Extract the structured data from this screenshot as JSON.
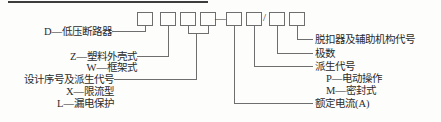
{
  "diagram": {
    "title_bar_present": true,
    "type": "model-designation-breakdown",
    "boxes": [
      {
        "id": "box-1",
        "label": "",
        "x": 137,
        "y": 12,
        "w": 16,
        "h": 14
      },
      {
        "id": "box-2",
        "label": "",
        "x": 160,
        "y": 12,
        "w": 16,
        "h": 14
      },
      {
        "id": "box-3",
        "label": "",
        "x": 180,
        "y": 12,
        "w": 16,
        "h": 14
      },
      {
        "id": "box-4",
        "label": "",
        "x": 200,
        "y": 12,
        "w": 16,
        "h": 14
      },
      {
        "id": "box-5",
        "label": "",
        "x": 226,
        "y": 12,
        "w": 16,
        "h": 14
      },
      {
        "id": "box-6",
        "label": "",
        "x": 246,
        "y": 12,
        "w": 16,
        "h": 14
      },
      {
        "id": "box-7",
        "label": "",
        "x": 269,
        "y": 12,
        "w": 16,
        "h": 14
      },
      {
        "id": "box-8",
        "label": "",
        "x": 289,
        "y": 12,
        "w": 16,
        "h": 14
      }
    ],
    "separators": [
      {
        "id": "dash-separator",
        "glyph": "—",
        "x": 215,
        "y": 14
      },
      {
        "id": "slash-separator",
        "glyph": "/",
        "x": 263,
        "y": 13
      }
    ],
    "left_labels": [
      {
        "id": "label-d",
        "text": "D—低压断路器",
        "x": 36,
        "y": 28
      },
      {
        "id": "label-z",
        "text": "Z—塑料外壳式",
        "x": 57,
        "y": 53
      },
      {
        "id": "label-w",
        "text": "W—框架式",
        "x": 57,
        "y": 64
      },
      {
        "id": "label-design-serial",
        "text": "设计序号及派生代号",
        "x": 11,
        "y": 76
      },
      {
        "id": "label-x",
        "text": "X—限流型",
        "x": 63,
        "y": 88
      },
      {
        "id": "label-l",
        "text": "L—漏电保护",
        "x": 55,
        "y": 100
      }
    ],
    "right_labels": [
      {
        "id": "label-release-aux",
        "text": "脱扣器及辅助机构代号",
        "x": 316,
        "y": 36
      },
      {
        "id": "label-poles",
        "text": "极数",
        "x": 316,
        "y": 50
      },
      {
        "id": "label-derivative",
        "text": "派生代号",
        "x": 316,
        "y": 63
      },
      {
        "id": "label-p",
        "text": "P—电动操作",
        "x": 325,
        "y": 75
      },
      {
        "id": "label-m",
        "text": "M—密封式",
        "x": 325,
        "y": 87
      },
      {
        "id": "label-rated-current",
        "text": "额定电流(A)",
        "x": 316,
        "y": 100
      }
    ],
    "colors": {
      "line": "#6e6e6e",
      "box_stroke": "#6e6e6e",
      "text": "#2b2b2b",
      "top_rule": "#3d3d3d",
      "background": "#fdfdfc"
    }
  }
}
